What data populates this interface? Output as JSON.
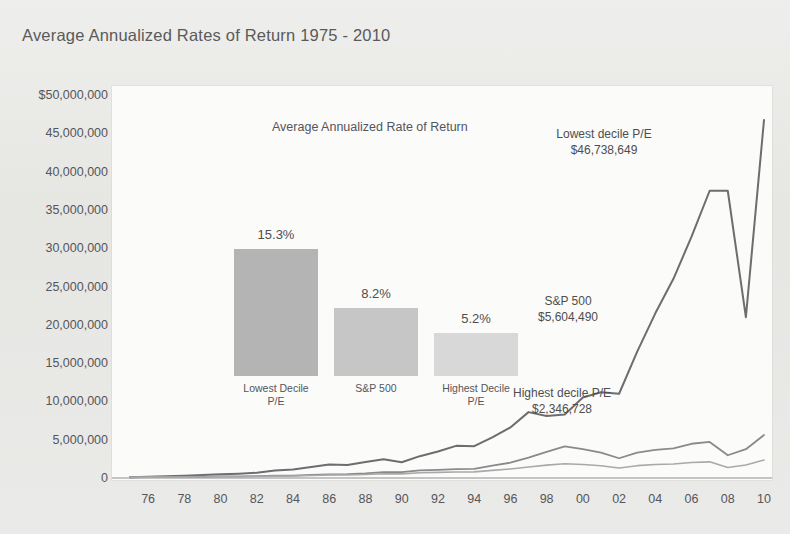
{
  "title": "Average Annualized Rates of Return 1975 - 2010",
  "colors": {
    "page_background": "#e9e9e7",
    "plot_background": "#fbfbfa",
    "text": "#55555a",
    "line_lowest_decile": "#6d6d70",
    "line_sp500": "#8a8a8d",
    "line_highest_decile": "#a9a9ab",
    "bar_lowest_decile": "#b4b4b4",
    "bar_sp500": "#c6c6c6",
    "bar_highest_decile": "#d8d8d8"
  },
  "axes": {
    "y_ticks": [
      "$50,000,000",
      "45,000,000",
      "40,000,000",
      "35,000,000",
      "30,000,000",
      "25,000,000",
      "20,000,000",
      "15,000,000",
      "10,000,000",
      "5,000,000",
      "0"
    ],
    "x_ticks": [
      "76",
      "78",
      "80",
      "82",
      "84",
      "86",
      "88",
      "90",
      "92",
      "94",
      "96",
      "98",
      "00",
      "02",
      "04",
      "06",
      "08",
      "10"
    ]
  },
  "inset": {
    "title": "Average Annualized Rate of Return",
    "bars": [
      {
        "label_line1": "Lowest Decile",
        "label_line2": "P/E",
        "value_label": "15.3%",
        "value": 15.3
      },
      {
        "label_line1": "S&P 500",
        "label_line2": "",
        "value_label": "8.2%",
        "value": 8.2
      },
      {
        "label_line1": "Highest Decile",
        "label_line2": "P/E",
        "value_label": "5.2%",
        "value": 5.2
      }
    ]
  },
  "annotations": [
    {
      "name": "lowest-decile",
      "line1": "Lowest decile P/E",
      "line2": "$46,738,649"
    },
    {
      "name": "sp500",
      "line1": "S&P 500",
      "line2": "$5,604,490"
    },
    {
      "name": "highest-decile",
      "line1": "Highest decile P/E",
      "line2": "$2,346,728"
    }
  ],
  "chart_data": {
    "type": "line",
    "title": "Average Annualized Rates of Return 1975 - 2010",
    "xlabel": "",
    "ylabel": "",
    "ylim": [
      0,
      50000000
    ],
    "xlim": [
      1975,
      2010
    ],
    "grid": false,
    "legend_position": "annotations-on-lines",
    "x": [
      1975,
      1976,
      1977,
      1978,
      1979,
      1980,
      1981,
      1982,
      1983,
      1984,
      1985,
      1986,
      1987,
      1988,
      1989,
      1990,
      1991,
      1992,
      1993,
      1994,
      1995,
      1996,
      1997,
      1998,
      1999,
      2000,
      2001,
      2002,
      2003,
      2004,
      2005,
      2006,
      2007,
      2008,
      2009,
      2010
    ],
    "series": [
      {
        "name": "Lowest decile P/E",
        "annualized_rate_pct": 15.3,
        "final_value_label": "$46,738,649",
        "final_value": 46738649,
        "values": [
          100000,
          150000,
          230000,
          300000,
          380000,
          480000,
          560000,
          680000,
          980000,
          1100000,
          1450000,
          1750000,
          1700000,
          2100000,
          2450000,
          2050000,
          2850000,
          3450000,
          4200000,
          4150000,
          5300000,
          6600000,
          8600000,
          8100000,
          8300000,
          10500000,
          11200000,
          11000000,
          16500000,
          21500000,
          26000000,
          31500000,
          37500000,
          37500000,
          21000000,
          46738649
        ]
      },
      {
        "name": "S&P 500",
        "annualized_rate_pct": 8.2,
        "final_value_label": "$5,604,490",
        "final_value": 5604490,
        "values": [
          100000,
          130000,
          125000,
          135000,
          160000,
          210000,
          200000,
          240000,
          295000,
          310000,
          410000,
          485000,
          510000,
          595000,
          780000,
          755000,
          985000,
          1060000,
          1165000,
          1180000,
          1620000,
          1995000,
          2660000,
          3420000,
          4140000,
          3760000,
          3310000,
          2580000,
          3320000,
          3680000,
          3860000,
          4470000,
          4710000,
          2970000,
          3760000,
          5604490
        ]
      },
      {
        "name": "Highest decile P/E",
        "annualized_rate_pct": 5.2,
        "final_value_label": "$2,346,728",
        "final_value": 2346728,
        "values": [
          100000,
          118000,
          112000,
          120000,
          140000,
          175000,
          170000,
          200000,
          245000,
          255000,
          330000,
          385000,
          395000,
          450000,
          560000,
          540000,
          680000,
          730000,
          790000,
          800000,
          1000000,
          1180000,
          1430000,
          1680000,
          1870000,
          1760000,
          1600000,
          1310000,
          1610000,
          1760000,
          1830000,
          2030000,
          2110000,
          1380000,
          1690000,
          2346728
        ]
      }
    ]
  }
}
